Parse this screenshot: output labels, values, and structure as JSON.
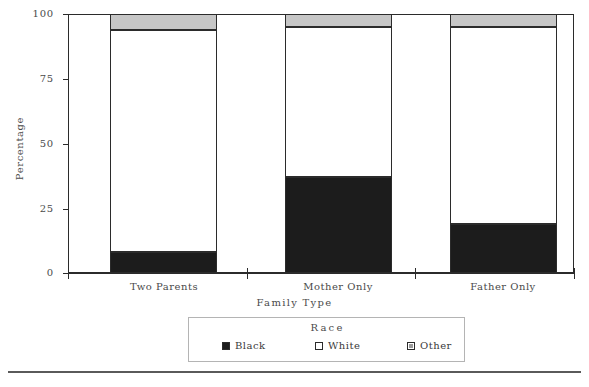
{
  "chart_data": {
    "type": "bar",
    "stacked": true,
    "title": "",
    "xlabel": "Family  Type",
    "ylabel": "Percentage",
    "categories": [
      "Two  Parents",
      "Mother  Only",
      "Father  Only"
    ],
    "ylim": [
      0,
      100
    ],
    "yticks": [
      0,
      25,
      50,
      75,
      100
    ],
    "ytick_labels": [
      "0",
      "25",
      "50",
      "75",
      "100"
    ],
    "grid": false,
    "legend_title": "Race",
    "legend_position": "bottom",
    "series": [
      {
        "name": "Black",
        "color": "#1c1c1c",
        "values": [
          8,
          37,
          19
        ]
      },
      {
        "name": "White",
        "color": "#ffffff",
        "values": [
          86,
          58,
          76
        ]
      },
      {
        "name": "Other",
        "color": "#c6c6c6",
        "values": [
          6,
          5,
          5
        ]
      }
    ]
  },
  "axis": {
    "ylabel": "Percentage",
    "xlabel": "Family  Type",
    "ytick_labels": [
      "100",
      "75",
      "50",
      "25",
      "0"
    ],
    "categories": [
      "Two  Parents",
      "Mother  Only",
      "Father  Only"
    ]
  },
  "legend": {
    "title": "Race",
    "items": [
      {
        "label": "Black",
        "swatch": "black-swatch"
      },
      {
        "label": "White",
        "swatch": "white-swatch"
      },
      {
        "label": "Other",
        "swatch": "other-swatch"
      }
    ]
  }
}
